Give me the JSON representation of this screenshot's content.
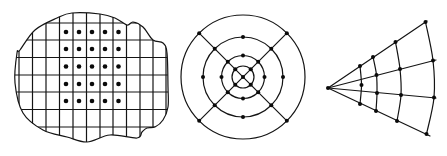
{
  "figure": {
    "width": 447,
    "height": 156,
    "stroke_color": "#141414",
    "dot_color": "#0a0a0a",
    "background": "#ffffff"
  },
  "panels": [
    {
      "id": "cartesian-grid",
      "description": "Irregular blob region overlaid with a square grid; 5x5 block of sample dots",
      "outline_points": [
        [
          20,
          50
        ],
        [
          35,
          30
        ],
        [
          57,
          18
        ],
        [
          72,
          13
        ],
        [
          100,
          14
        ],
        [
          115,
          18
        ],
        [
          127,
          25
        ],
        [
          133,
          22
        ],
        [
          143,
          27
        ],
        [
          153,
          40
        ],
        [
          163,
          43
        ],
        [
          167,
          53
        ],
        [
          168,
          87
        ],
        [
          168,
          107
        ],
        [
          163,
          120
        ],
        [
          155,
          127
        ],
        [
          147,
          128
        ],
        [
          142,
          132
        ],
        [
          137,
          138
        ],
        [
          110,
          135
        ],
        [
          87,
          142
        ],
        [
          67,
          137
        ],
        [
          43,
          130
        ],
        [
          23,
          113
        ],
        [
          15,
          83
        ],
        [
          17,
          53
        ]
      ],
      "grid_x": [
        19,
        32.5,
        46,
        59.5,
        73,
        86.5,
        100,
        113,
        126.5,
        140,
        153,
        166
      ],
      "grid_y": [
        23,
        40,
        57.5,
        75,
        92,
        109.5,
        127
      ],
      "dots_x": [
        66,
        79,
        92,
        105,
        118.5
      ],
      "dots_y": [
        32,
        49,
        66.5,
        84,
        101
      ]
    },
    {
      "id": "polar-rings",
      "description": "Concentric circles with two diagonal lines through center; dots at intersections and cardinal points",
      "center": [
        243,
        77
      ],
      "radii": [
        62,
        40,
        21.5,
        11
      ],
      "diagonal_angles_deg": [
        45,
        135
      ],
      "dots": {
        "outer_ring": "diagonals",
        "ring_2": "diagonals+cardinals",
        "ring_3": "diagonals+cardinals",
        "ring_4": "diagonals",
        "center": true
      }
    },
    {
      "id": "fan-rays",
      "description": "Fan of four rays from an apex, crossed by four arcs; dots at intersections",
      "apex": [
        328,
        88
      ],
      "rays": [
        [
          [
            328,
            88
          ],
          [
            427,
            21
          ]
        ],
        [
          [
            328,
            88
          ],
          [
            436,
            60
          ]
        ],
        [
          [
            328,
            88
          ],
          [
            436,
            98
          ]
        ],
        [
          [
            328,
            88
          ],
          [
            430,
            136
          ]
        ]
      ],
      "arcs": [
        [
          [
            360,
            66
          ],
          [
            361.5,
            85
          ],
          [
            360,
            104
          ]
        ],
        [
          [
            373,
            57
          ],
          [
            376.5,
            75
          ],
          [
            377,
            93
          ],
          [
            376,
            111
          ]
        ],
        [
          [
            395.5,
            42
          ],
          [
            400,
            69
          ],
          [
            401,
            95
          ],
          [
            397,
            121
          ]
        ],
        [
          [
            425.5,
            22
          ],
          [
            433,
            60.5
          ],
          [
            434,
            97.5
          ],
          [
            426.5,
            134
          ]
        ]
      ],
      "dots": [
        [
          328,
          88
        ],
        [
          360,
          66
        ],
        [
          361.5,
          85
        ],
        [
          360,
          104
        ],
        [
          373,
          57
        ],
        [
          376.5,
          75
        ],
        [
          377,
          93
        ],
        [
          376,
          111
        ],
        [
          395.5,
          42
        ],
        [
          400,
          69
        ],
        [
          401,
          95
        ],
        [
          397,
          121
        ],
        [
          425.5,
          22
        ],
        [
          433,
          60.5
        ],
        [
          434,
          97.5
        ],
        [
          426.5,
          134
        ]
      ]
    }
  ]
}
